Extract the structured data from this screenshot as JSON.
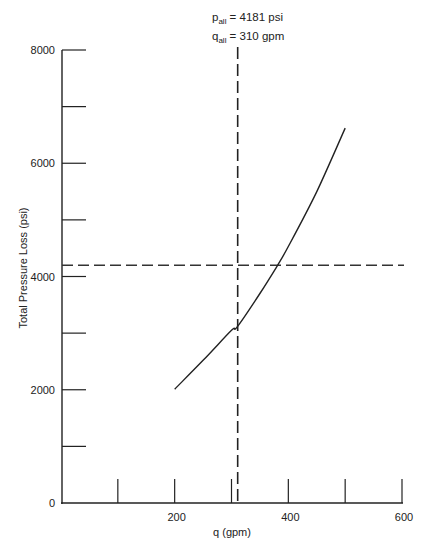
{
  "chart_data": {
    "type": "line",
    "title": "",
    "xlabel": "q (gpm)",
    "ylabel": "Total Pressure Loss (psi)",
    "xlim": [
      0,
      600
    ],
    "ylim": [
      0,
      8000
    ],
    "grid": false,
    "x_ticks": [
      0,
      100,
      200,
      300,
      400,
      500,
      600
    ],
    "x_tick_labels": [
      "",
      "",
      "200",
      "",
      "400",
      "",
      "600"
    ],
    "y_ticks": [
      0,
      1000,
      2000,
      3000,
      4000,
      5000,
      6000,
      7000,
      8000
    ],
    "y_tick_labels": [
      "0",
      "",
      "2000",
      "",
      "4000",
      "",
      "6000",
      "",
      "8000"
    ],
    "series": [
      {
        "name": "Total pressure loss",
        "style": "solid",
        "x": [
          200,
          250,
          300,
          310,
          350,
          380,
          400,
          450,
          500
        ],
        "y": [
          2010,
          2520,
          3050,
          3110,
          3700,
          4181,
          4530,
          5500,
          6620
        ]
      }
    ],
    "reference_lines": [
      {
        "orientation": "horizontal",
        "value": 4181,
        "style": "dashed",
        "label": "p_all"
      },
      {
        "orientation": "vertical",
        "value": 310,
        "style": "dashed",
        "label": "q_all"
      }
    ],
    "annotations": [
      {
        "var": "p",
        "sub": "all",
        "text": " = 4181 psi"
      },
      {
        "var": "q",
        "sub": "all",
        "text": " = 310 gpm"
      }
    ]
  }
}
